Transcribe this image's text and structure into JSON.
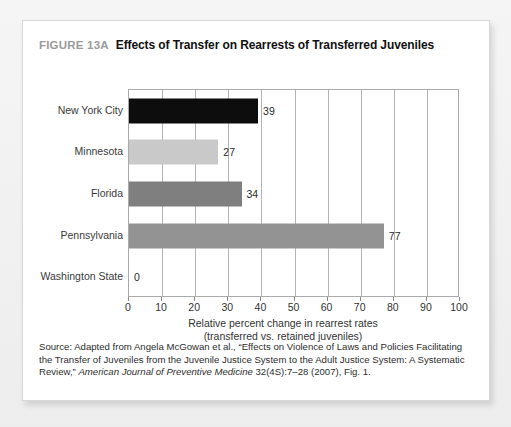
{
  "figure": {
    "number_label": "FIGURE 13A",
    "caption": "Effects of Transfer on Rearrests of Transferred Juveniles"
  },
  "source": {
    "prefix": "Source: Adapted from Angela McGowan et al., “Effects on Violence of Laws and Policies Facilitating the Transfer of Juveniles from the Juvenile Justice System to the Adult Justice System: A Systematic Review,” ",
    "journal": "American Journal of Preventive Medicine",
    "suffix": " 32(4S):7–28 (2007), Fig. 1."
  },
  "chart_data": {
    "type": "bar",
    "orientation": "horizontal",
    "title": "Effects of Transfer on Rearrests of Transferred Juveniles",
    "xlabel": "Relative percent change in rearrest rates",
    "xlabel_line2": "(transferred vs. retained juveniles)",
    "ylabel": "",
    "xlim": [
      0,
      100
    ],
    "xticks": [
      0,
      10,
      20,
      30,
      40,
      50,
      60,
      70,
      80,
      90,
      100
    ],
    "grid": true,
    "legend": "none",
    "categories": [
      "New York City",
      "Minnesota",
      "Florida",
      "Pennsylvania",
      "Washington State"
    ],
    "values": [
      39,
      27,
      34,
      77,
      0
    ],
    "value_labels": [
      "39",
      "27",
      "34",
      "77",
      "0"
    ],
    "bar_colors": [
      "#0d0d0d",
      "#c9c9c9",
      "#7f7f7f",
      "#939393",
      "#ffffff"
    ]
  }
}
